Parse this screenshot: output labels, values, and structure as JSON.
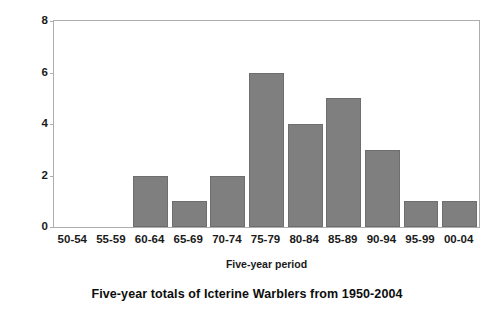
{
  "chart_data": {
    "type": "bar",
    "title": "Five-year totals of Icterine Warblers from 1950-2004",
    "xlabel": "Five-year period",
    "ylabel": "Number of individuals",
    "categories": [
      "50-54",
      "55-59",
      "60-64",
      "65-69",
      "70-74",
      "75-79",
      "80-84",
      "85-89",
      "90-94",
      "95-99",
      "00-04"
    ],
    "values": [
      0,
      0,
      2,
      1,
      2,
      6,
      4,
      5,
      3,
      1,
      1
    ],
    "ylim": [
      0,
      8
    ],
    "yticks": [
      0,
      2,
      4,
      6,
      8
    ],
    "ytick_labels": [
      "0",
      "2",
      "4",
      "6",
      "8"
    ],
    "grid": false,
    "legend": false,
    "bar_color": "#7f7f7f",
    "bar_edge_color": "#6e6e6e",
    "axis_color": "#adadad",
    "background": "#ffffff"
  }
}
